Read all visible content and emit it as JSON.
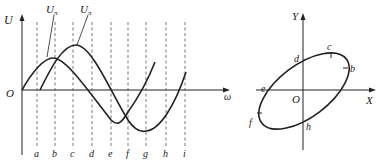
{
  "left_chart": {
    "y_axis_label": "U",
    "x_axis_label": "ω",
    "origin_label": "O",
    "curve_labels": [
      {
        "main": "U",
        "sub": "π"
      },
      {
        "main": "U",
        "sub": "π"
      }
    ],
    "tick_labels": [
      "a",
      "b",
      "c",
      "d",
      "e",
      "f",
      "g",
      "h",
      "i"
    ]
  },
  "right_chart": {
    "y_axis_label": "Y",
    "x_axis_label": "X",
    "origin_label": "O",
    "point_labels": {
      "b": "b",
      "c": "c",
      "d": "d",
      "e": "e",
      "f": "f",
      "h": "h"
    }
  },
  "colors": {
    "line": "#222222",
    "dash": "#555555"
  }
}
